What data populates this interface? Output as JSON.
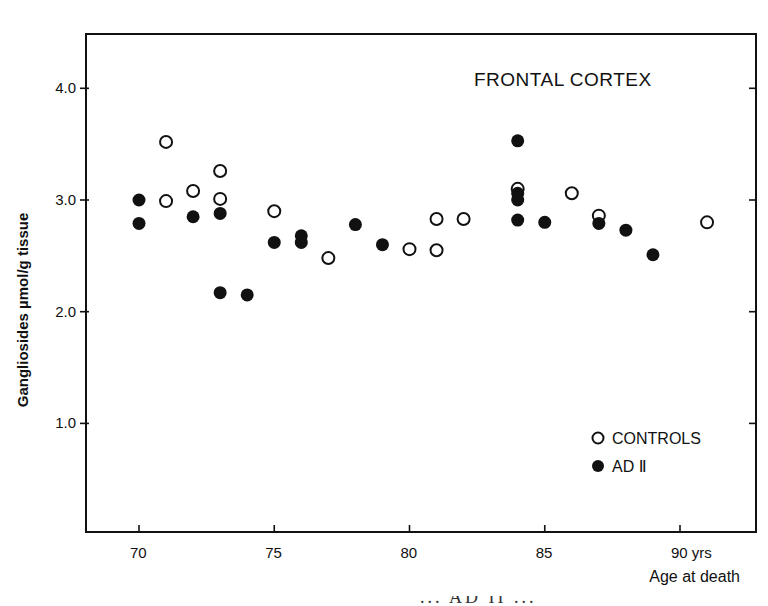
{
  "chart_data": {
    "type": "scatter",
    "title": "FRONTAL CORTEX",
    "xlabel": "Age at death",
    "x_unit_label": "yrs",
    "ylabel": "Gangliosides µmol/g tissue",
    "xlim": [
      68,
      93
    ],
    "ylim": [
      0,
      4.5
    ],
    "x_ticks": [
      70,
      75,
      80,
      85,
      90
    ],
    "x_tick_labels": [
      "70",
      "75",
      "80",
      "85",
      "90 yrs"
    ],
    "y_ticks": [
      1.0,
      2.0,
      3.0,
      4.0
    ],
    "y_tick_labels": [
      "1.0",
      "2.0",
      "3.0",
      "4.0"
    ],
    "grid": false,
    "legend_position": "lower right",
    "series": [
      {
        "name": "CONTROLS",
        "marker": "open-circle",
        "points": [
          {
            "x": 71,
            "y": 3.52
          },
          {
            "x": 71,
            "y": 2.99
          },
          {
            "x": 72,
            "y": 3.08
          },
          {
            "x": 73,
            "y": 3.26
          },
          {
            "x": 73,
            "y": 3.01
          },
          {
            "x": 75,
            "y": 2.9
          },
          {
            "x": 77,
            "y": 2.48
          },
          {
            "x": 80,
            "y": 2.56
          },
          {
            "x": 81,
            "y": 2.83
          },
          {
            "x": 81,
            "y": 2.55
          },
          {
            "x": 82,
            "y": 2.83
          },
          {
            "x": 84,
            "y": 3.1
          },
          {
            "x": 86,
            "y": 3.06
          },
          {
            "x": 87,
            "y": 2.86
          },
          {
            "x": 91,
            "y": 2.8
          }
        ]
      },
      {
        "name": "AD II",
        "marker": "filled-circle",
        "points": [
          {
            "x": 70,
            "y": 3.0
          },
          {
            "x": 70,
            "y": 2.79
          },
          {
            "x": 72,
            "y": 2.85
          },
          {
            "x": 73,
            "y": 2.88
          },
          {
            "x": 73,
            "y": 2.17
          },
          {
            "x": 74,
            "y": 2.15
          },
          {
            "x": 75,
            "y": 2.62
          },
          {
            "x": 76,
            "y": 2.68
          },
          {
            "x": 76,
            "y": 2.62
          },
          {
            "x": 78,
            "y": 2.78
          },
          {
            "x": 79,
            "y": 2.6
          },
          {
            "x": 84,
            "y": 3.53
          },
          {
            "x": 84,
            "y": 3.06
          },
          {
            "x": 84,
            "y": 3.0
          },
          {
            "x": 84,
            "y": 2.82
          },
          {
            "x": 85,
            "y": 2.8
          },
          {
            "x": 87,
            "y": 2.79
          },
          {
            "x": 88,
            "y": 2.73
          },
          {
            "x": 89,
            "y": 2.51
          }
        ]
      }
    ]
  },
  "legend": {
    "items": [
      {
        "label": "CONTROLS",
        "symbol": "○"
      },
      {
        "label": "AD Ⅱ",
        "symbol": "●"
      }
    ]
  },
  "colors": {
    "ink": "#111111",
    "background": "#ffffff"
  },
  "caption_fragment": "... AD II ..."
}
